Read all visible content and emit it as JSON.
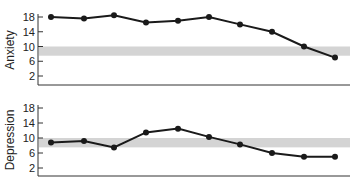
{
  "chart_data": [
    {
      "type": "line",
      "title": "",
      "xlabel": "",
      "ylabel": "Anxiety",
      "ylim": [
        0,
        19
      ],
      "yticks": [
        2,
        6,
        10,
        14,
        18
      ],
      "grid": false,
      "x": [
        1,
        2,
        3,
        4,
        5,
        6,
        7,
        8,
        9,
        10
      ],
      "series": [
        {
          "name": "Anxiety",
          "values": [
            18,
            17.6,
            18.5,
            16.5,
            17,
            18,
            16,
            14,
            10,
            7
          ]
        }
      ],
      "reference_band": {
        "from": 7.5,
        "to": 10,
        "label": "normal range"
      }
    },
    {
      "type": "line",
      "title": "",
      "xlabel": "",
      "ylabel": "Depression",
      "ylim": [
        0,
        19
      ],
      "yticks": [
        2,
        6,
        10,
        14,
        18
      ],
      "grid": false,
      "x": [
        1,
        2,
        3,
        4,
        5,
        6,
        7,
        8,
        9,
        10
      ],
      "series": [
        {
          "name": "Depression",
          "values": [
            8.8,
            9.2,
            7.5,
            11.5,
            12.5,
            10.3,
            8.3,
            6,
            5,
            5
          ]
        }
      ],
      "reference_band": {
        "from": 7.5,
        "to": 10,
        "label": "normal range"
      }
    }
  ],
  "panels": {
    "top": {
      "ylabel": "Anxiety",
      "ticks": [
        "18",
        "14",
        "10",
        "6",
        "2"
      ]
    },
    "bottom": {
      "ylabel": "Depression",
      "ticks": [
        "18",
        "14",
        "10",
        "6",
        "2"
      ]
    }
  },
  "colors": {
    "line": "#1a1a1a",
    "band": "#d4d4d4",
    "axis": "#333333"
  }
}
